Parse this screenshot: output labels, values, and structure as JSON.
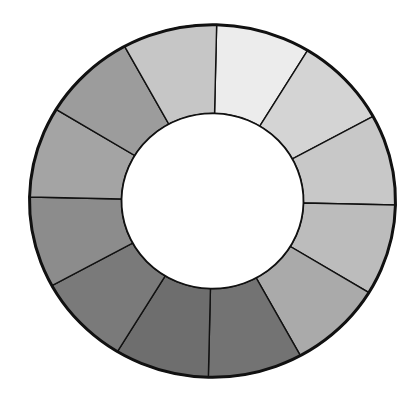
{
  "figure": {
    "title": "",
    "type": "grayscale-value-wheel",
    "background": "#ffffff",
    "center": [
      212.5,
      201
    ],
    "outer_radius": 183,
    "inner_radius": 91,
    "vertical_scale": 0.963,
    "rotation_deg": 1.3,
    "outline_color": "#111111",
    "center_fill": "#ffffff"
  },
  "segments": [
    {
      "index": 1,
      "start_deg": 0,
      "end_deg": 30,
      "fill": "#ececec"
    },
    {
      "index": 2,
      "start_deg": 30,
      "end_deg": 60,
      "fill": "#d4d4d4"
    },
    {
      "index": 3,
      "start_deg": 60,
      "end_deg": 90,
      "fill": "#c8c8c8"
    },
    {
      "index": 4,
      "start_deg": 90,
      "end_deg": 120,
      "fill": "#bcbcbc"
    },
    {
      "index": 5,
      "start_deg": 120,
      "end_deg": 150,
      "fill": "#aaaaaa"
    },
    {
      "index": 6,
      "start_deg": 150,
      "end_deg": 180,
      "fill": "#737373"
    },
    {
      "index": 7,
      "start_deg": 180,
      "end_deg": 210,
      "fill": "#6e6e6e"
    },
    {
      "index": 8,
      "start_deg": 210,
      "end_deg": 240,
      "fill": "#7a7a7a"
    },
    {
      "index": 9,
      "start_deg": 240,
      "end_deg": 270,
      "fill": "#8c8c8c"
    },
    {
      "index": 10,
      "start_deg": 270,
      "end_deg": 300,
      "fill": "#a4a4a4"
    },
    {
      "index": 11,
      "start_deg": 300,
      "end_deg": 330,
      "fill": "#9c9c9c"
    },
    {
      "index": 12,
      "start_deg": 330,
      "end_deg": 360,
      "fill": "#c6c6c6"
    }
  ]
}
